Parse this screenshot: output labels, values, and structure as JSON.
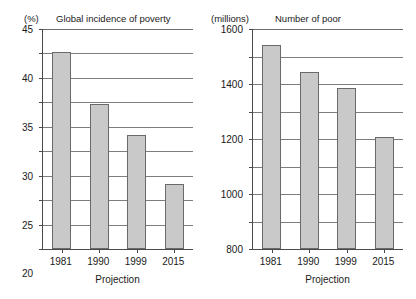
{
  "chart_data": [
    {
      "type": "bar",
      "panel": "left",
      "title": "Global incidence of poverty",
      "unit_label": "(%)",
      "xlabel": "Projection",
      "ylabel": "",
      "categories": [
        "1981",
        "1990",
        "1999",
        "2015"
      ],
      "values": [
        40.4,
        29.7,
        23.4,
        13.4
      ],
      "ylim": [
        0,
        45
      ],
      "ytick_step": 5,
      "yticks": [
        45,
        40,
        35,
        30,
        25,
        20,
        15,
        10,
        5,
        0
      ],
      "grid": true,
      "legend": "none",
      "bar_fill": "#c9c9c9",
      "bar_border": "#6a6a6a"
    },
    {
      "type": "bar",
      "panel": "right",
      "title": "Number of poor",
      "unit_label": "(millions)",
      "xlabel": "Projection",
      "ylabel": "",
      "categories": [
        "1981",
        "1990",
        "1999",
        "2015"
      ],
      "values": [
        1485,
        1290,
        1170,
        815
      ],
      "ylim": [
        0,
        1600
      ],
      "ytick_step": 200,
      "yticks": [
        1600,
        1400,
        1200,
        1000,
        800,
        600,
        400,
        200,
        0
      ],
      "grid": true,
      "legend": "none",
      "bar_fill": "#c9c9c9",
      "bar_border": "#6a6a6a"
    }
  ],
  "colors": {
    "bar_fill": "#c9c9c9",
    "bar_border": "#6a6a6a",
    "axis": "#4a4a4a",
    "grid": "#7d7d7d",
    "text": "#1a1a1a",
    "background": "#ffffff"
  }
}
